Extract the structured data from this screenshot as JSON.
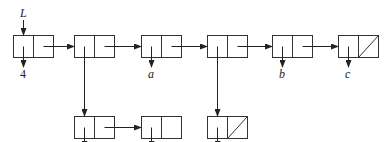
{
  "diagram": {
    "type": "linked-list cons-cell diagram",
    "pointer_label": "L",
    "top_row": [
      {
        "id": "n1",
        "car": "4",
        "cdr": "n2"
      },
      {
        "id": "n2",
        "car": "sub1",
        "cdr": "n3"
      },
      {
        "id": "n3",
        "car": "a",
        "cdr": "n4"
      },
      {
        "id": "n4",
        "car": "sub2",
        "cdr": "n5"
      },
      {
        "id": "n5",
        "car": "b",
        "cdr": "n6"
      },
      {
        "id": "n6",
        "car": "c",
        "cdr": "nil"
      }
    ],
    "sub_lists": [
      {
        "id": "sub1",
        "cells": [
          {
            "car": "3",
            "cdr": "next"
          },
          {
            "car": "7",
            "cdr": "empty"
          }
        ]
      },
      {
        "id": "sub2",
        "cells": [
          {
            "car": "5",
            "cdr": "nil"
          }
        ]
      }
    ],
    "labels": {
      "L": "L",
      "v4": "4",
      "va": "a",
      "vb": "b",
      "vc": "c",
      "v3": "3",
      "v7": "7",
      "v5": "5"
    }
  }
}
